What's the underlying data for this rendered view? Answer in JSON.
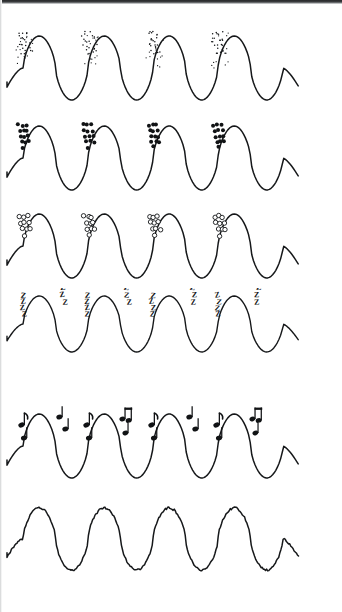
{
  "figure": {
    "background_color": "#ffffff",
    "stroke_color": "#16181a",
    "width": 342,
    "height": 612,
    "scan_artifact_top": "dark scan band across top edge"
  },
  "chart_data": {
    "type": "line",
    "subtitle": "",
    "xlabel": "",
    "ylabel": "",
    "grid": false,
    "legend_position": "none",
    "axis_visible": false,
    "tick_labels": [],
    "annotations": [
      "row 1: fine stipple dots on each rising edge",
      "row 2: bold filled dots clustered on each rising edge",
      "row 3: open circles clustered on each rising edge",
      "row 4: letter Z repeated along rising edges and in midair",
      "row 5: musical notes along rising edges and in midair",
      "row 6: jagged / noisy waveform, undecorated"
    ],
    "x": [
      0,
      0.25,
      0.5,
      0.75,
      1
    ],
    "shared_waveform": {
      "cycles": 4,
      "amplitude": 1,
      "baseline": 0,
      "x_start_px": 23,
      "x_end_px": 283
    },
    "series": [
      {
        "name": "Wave 1 — fine stipple",
        "marker": "tiny-dot",
        "marker_count_per_cycle": 18,
        "values": [
          0,
          1,
          0,
          -1,
          0
        ],
        "y_top_px": 36,
        "y_bottom_px": 100
      },
      {
        "name": "Wave 2 — bold dots",
        "marker": "filled-circle",
        "marker_count_per_cycle": 12,
        "values": [
          0,
          1,
          0,
          -1,
          0
        ],
        "y_top_px": 126,
        "y_bottom_px": 190
      },
      {
        "name": "Wave 3 — open circles",
        "marker": "open-circle",
        "marker_count_per_cycle": 9,
        "values": [
          0,
          1,
          0,
          -1,
          0
        ],
        "y_top_px": 214,
        "y_bottom_px": 278
      },
      {
        "name": "Wave 4 — letter Z",
        "marker": "letter-z",
        "marker_count_per_cycle": 7,
        "values": [
          0,
          1,
          0,
          -1,
          0
        ],
        "y_top_px": 296,
        "y_bottom_px": 352
      },
      {
        "name": "Wave 5 — musical notes",
        "marker": "music-note",
        "marker_count_per_cycle": 5,
        "values": [
          0,
          1,
          0,
          -1,
          0
        ],
        "y_top_px": 414,
        "y_bottom_px": 478
      },
      {
        "name": "Wave 6 — jagged noise",
        "marker": "none",
        "marker_count_per_cycle": 0,
        "values": [
          0,
          1,
          0,
          -1,
          0
        ],
        "y_top_px": 505,
        "y_bottom_px": 568
      }
    ]
  },
  "rows": [
    {
      "id": "row-stipple",
      "label": "Fine stipple dots",
      "glyph": "•",
      "glyph_name": "tiny-dot",
      "top": 20,
      "height": 96,
      "wave_top": 16,
      "wave_bottom": 80,
      "stroke_width": 1.5,
      "jagged": false,
      "decor": {
        "kind": "dots",
        "radius": 0.75,
        "filled": true,
        "columns": 5,
        "rows": 5,
        "spread_x": 12,
        "spread_y": 30,
        "count": 20,
        "offset_x": -12,
        "offset_y": 4
      }
    },
    {
      "id": "row-bold-dots",
      "label": "Bold filled dots",
      "glyph": "●",
      "glyph_name": "filled-circle",
      "top": 110,
      "height": 96,
      "wave_top": 16,
      "wave_bottom": 80,
      "stroke_width": 1.5,
      "jagged": false,
      "decor": {
        "kind": "dots",
        "radius": 2.0,
        "filled": true,
        "columns": 3,
        "rows": 5,
        "spread_x": 11,
        "spread_y": 28,
        "count": 13,
        "offset_x": -11,
        "offset_y": 4
      }
    },
    {
      "id": "row-open-circles",
      "label": "Open circles",
      "glyph": "○",
      "glyph_name": "open-circle",
      "top": 198,
      "height": 96,
      "wave_top": 16,
      "wave_bottom": 80,
      "stroke_width": 1.5,
      "jagged": false,
      "decor": {
        "kind": "rings",
        "radius": 2.2,
        "filled": false,
        "columns": 3,
        "rows": 4,
        "spread_x": 11,
        "spread_y": 25,
        "count": 10,
        "offset_x": -10,
        "offset_y": 6
      }
    },
    {
      "id": "row-z-letters",
      "label": "Sleeping Z letters",
      "glyph": "Z",
      "glyph_name": "letter-z",
      "top": 288,
      "height": 80,
      "wave_top": 8,
      "wave_bottom": 64,
      "stroke_width": 1.4,
      "jagged": false,
      "decor": {
        "kind": "letters",
        "text": "Z",
        "font_size": 8,
        "count": 4,
        "offset_x": -9,
        "offset_y": 4
      }
    },
    {
      "id": "row-music-notes",
      "label": "Musical notes",
      "glyph": "♪",
      "glyph_name": "music-note",
      "top": 404,
      "height": 92,
      "wave_top": 10,
      "wave_bottom": 74,
      "stroke_width": 1.5,
      "jagged": false,
      "decor": {
        "kind": "notes",
        "count": 3,
        "offset_x": -8,
        "offset_y": 6
      }
    },
    {
      "id": "row-jagged",
      "label": "Jagged noisy wave",
      "glyph": "",
      "glyph_name": "none",
      "top": 496,
      "height": 92,
      "wave_top": 12,
      "wave_bottom": 74,
      "stroke_width": 1.5,
      "jagged": true,
      "decor": {
        "kind": "none",
        "count": 0
      }
    }
  ]
}
